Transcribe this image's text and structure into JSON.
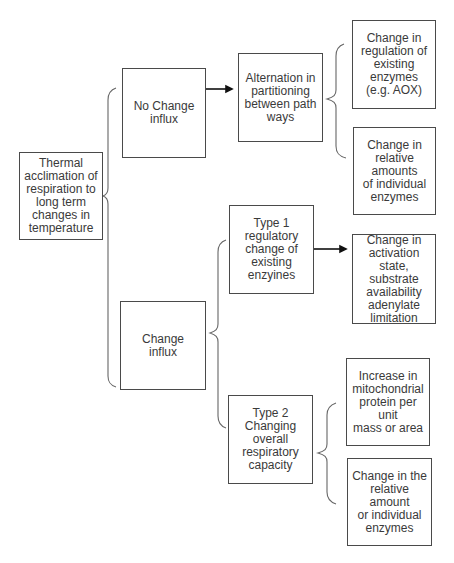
{
  "diagram": {
    "type": "tree / brace flowchart",
    "nodes": {
      "root": "Thermal\nacclimation of\nrespiration to\nlong term\nchanges in\ntemperature",
      "no_change": "No Change\ninflux",
      "change": "Change\ninflux",
      "alternation": "Alternation in\npartitioning\nbetween path\nways",
      "regulation": "Change in\nregulation of\nexisting enzymes\n(e.g. AOX)",
      "relative_amounts": "Change in\nrelative amounts\nof individual\nenzymes",
      "type1": "Type 1\nregulatory\nchange of\nexisting enzyines",
      "activation": "Change in\nactivation state,\nsubstrate\navailability\nadenylate\nlimitation",
      "type2": "Type 2\nChanging overall\nrespiratory\ncapacity",
      "mito_protein": "Increase in\nmitochondrial\nprotein per unit\nmass or area",
      "relative_amount_individual": "Change in the\nrelative amount\nor individual\nenzymes"
    },
    "edges": [
      {
        "from": "root",
        "to": [
          "no_change",
          "change"
        ],
        "style": "brace"
      },
      {
        "from": "no_change",
        "to": [
          "alternation"
        ],
        "style": "arrow"
      },
      {
        "from": "alternation",
        "to": [
          "regulation",
          "relative_amounts"
        ],
        "style": "brace"
      },
      {
        "from": "change",
        "to": [
          "type1",
          "type2"
        ],
        "style": "brace"
      },
      {
        "from": "type1",
        "to": [
          "activation"
        ],
        "style": "arrow"
      },
      {
        "from": "type2",
        "to": [
          "mito_protein",
          "relative_amount_individual"
        ],
        "style": "brace"
      }
    ],
    "colors": {
      "border": "#4a4a4a",
      "text": "#3a3a3a",
      "line": "#555555",
      "arrow": "#111111"
    }
  }
}
